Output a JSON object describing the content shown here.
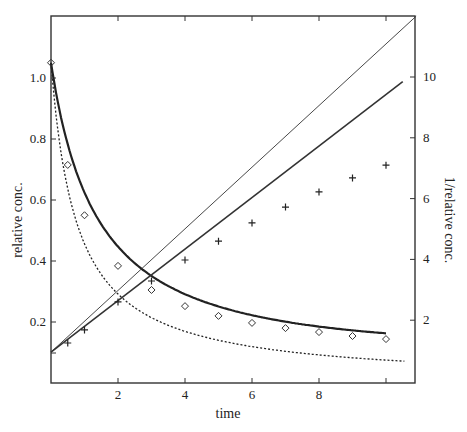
{
  "chart_data": {
    "type": "line",
    "title": "",
    "xlabel": "time",
    "ylabel": "relative conc.",
    "y2label": "1/relative conc.",
    "xlim": [
      0,
      10.9
    ],
    "ylim": [
      0,
      1.2
    ],
    "y2lim": [
      0,
      12
    ],
    "xticks": [
      2,
      4,
      6,
      8,
      10
    ],
    "xtick_labels": [
      "2",
      "4",
      "6",
      "8",
      ""
    ],
    "yticks": [
      0.2,
      0.4,
      0.6,
      0.8,
      1.0
    ],
    "ytick_labels": [
      "0.2",
      "0.4",
      "0.6",
      "0.8",
      "1.0"
    ],
    "y2ticks": [
      2,
      4,
      6,
      8,
      10
    ],
    "y2tick_labels": [
      "2",
      "4",
      "6",
      "8",
      "10"
    ],
    "grid": false,
    "legend": null,
    "series": [
      {
        "name": "relative conc. (observed, diamonds)",
        "axis": "left",
        "style": "markers-diamond",
        "x": [
          0,
          0.5,
          1,
          2,
          3,
          4,
          5,
          6,
          7,
          8,
          9,
          10
        ],
        "values": [
          1.05,
          0.715,
          0.55,
          0.384,
          0.305,
          0.252,
          0.22,
          0.197,
          0.18,
          0.167,
          0.154,
          0.144
        ]
      },
      {
        "name": "relative conc. fit (thick solid)",
        "axis": "left",
        "style": "line-thick",
        "x": [
          0,
          0.5,
          1,
          2,
          3,
          4,
          5,
          6,
          7,
          8,
          9,
          10
        ],
        "values": [
          1.05,
          0.74,
          0.57,
          0.4,
          0.31,
          0.255,
          0.215,
          0.187,
          0.165,
          0.148,
          0.135,
          0.125
        ]
      },
      {
        "name": "relative conc. model (dotted)",
        "axis": "left",
        "style": "line-dotted",
        "x": [
          0,
          0.5,
          1,
          2,
          3,
          4,
          5,
          6,
          7,
          8,
          9,
          10,
          10.6
        ],
        "values": [
          1.05,
          0.63,
          0.45,
          0.29,
          0.215,
          0.17,
          0.142,
          0.122,
          0.107,
          0.095,
          0.086,
          0.078,
          0.074
        ]
      },
      {
        "name": "1/relative conc. (observed, plus)",
        "axis": "right",
        "style": "markers-plus",
        "x": [
          0.5,
          1,
          2,
          3,
          4,
          5,
          6,
          7,
          8,
          9,
          10
        ],
        "values": [
          1.25,
          1.68,
          2.6,
          3.29,
          3.98,
          4.6,
          5.2,
          5.72,
          6.22,
          6.68,
          7.1
        ]
      },
      {
        "name": "1/relative conc. linear (thick)",
        "axis": "right",
        "style": "line-medium",
        "x": [
          0,
          10.5
        ],
        "values": [
          0.95,
          9.85
        ]
      },
      {
        "name": "1/relative conc. linear (thin)",
        "axis": "right",
        "style": "line-thin",
        "x": [
          0,
          10.9
        ],
        "values": [
          0.95,
          12.0
        ]
      }
    ]
  }
}
